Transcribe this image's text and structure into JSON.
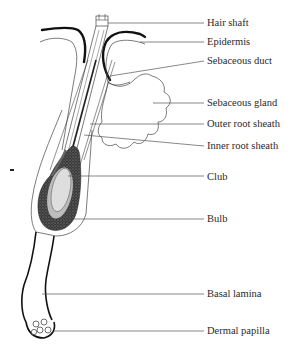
{
  "diagram": {
    "colors": {
      "ink": "#111111",
      "line": "#555555",
      "club_fill": "#d8d8d8",
      "bulb_stipple": "#2b2b2b",
      "background": "#ffffff"
    },
    "labels": [
      {
        "id": "hair-shaft",
        "text": "Hair shaft",
        "x": 207,
        "y": 17,
        "line_from": [
          108,
          23
        ],
        "line_to": [
          204,
          23
        ]
      },
      {
        "id": "epidermis",
        "text": "Epidermis",
        "x": 207,
        "y": 36,
        "line_from": [
          140,
          42
        ],
        "line_to": [
          204,
          42
        ]
      },
      {
        "id": "sebaceous-duct",
        "text": "Sebaceous duct",
        "x": 207,
        "y": 55,
        "line_from": [
          110,
          76
        ],
        "line_to": [
          204,
          61
        ]
      },
      {
        "id": "sebaceous-gland",
        "text": "Sebaceous gland",
        "x": 207,
        "y": 97,
        "line_from": [
          153,
          103
        ],
        "line_to": [
          204,
          103
        ]
      },
      {
        "id": "outer-root-sheath",
        "text": "Outer root sheath",
        "x": 207,
        "y": 118,
        "line_from": [
          90,
          124
        ],
        "line_to": [
          204,
          124
        ]
      },
      {
        "id": "inner-root-sheath",
        "text": "Inner root sheath",
        "x": 207,
        "y": 140,
        "line_from": [
          84,
          135
        ],
        "line_to": [
          204,
          146
        ]
      },
      {
        "id": "club",
        "text": "Club",
        "x": 207,
        "y": 171,
        "line_from": [
          68,
          176
        ],
        "line_to": [
          204,
          176
        ]
      },
      {
        "id": "bulb",
        "text": "Bulb",
        "x": 207,
        "y": 213,
        "line_from": [
          74,
          219
        ],
        "line_to": [
          204,
          219
        ]
      },
      {
        "id": "basal-lamina",
        "text": "Basal lamina",
        "x": 207,
        "y": 288,
        "line_from": [
          42,
          294
        ],
        "line_to": [
          204,
          294
        ]
      },
      {
        "id": "dermal-papilla",
        "text": "Dermal papilla",
        "x": 207,
        "y": 325,
        "line_from": [
          54,
          331
        ],
        "line_to": [
          204,
          331
        ]
      }
    ]
  }
}
